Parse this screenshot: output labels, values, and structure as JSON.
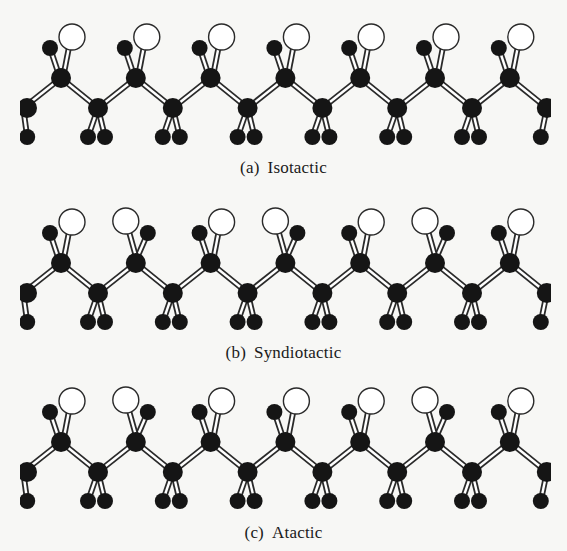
{
  "figure": {
    "width": 567,
    "height": 551,
    "colors": {
      "background": "#f7f7f5",
      "atom_dark": "#151515",
      "atom_light_fill": "#ffffff",
      "atom_light_stroke": "#2a2a2a",
      "bond_outline": "#2a2a2a",
      "bond_fill": "#ffffff"
    },
    "geometry": {
      "period": 74.8,
      "upper_x0": 61,
      "lower_x0": 98,
      "upper_dy": 0,
      "lower_dy": 30,
      "h_dy": 59,
      "carbon_r": 10,
      "h_r": 8,
      "sub_r": 13,
      "units": 7
    }
  },
  "panels": [
    {
      "id": "a",
      "label_tag": "(a)",
      "label_text": "Isotactic",
      "chain_y": 78,
      "label_y": 158,
      "substituent_sides": [
        "R",
        "R",
        "R",
        "R",
        "R",
        "R",
        "R"
      ]
    },
    {
      "id": "b",
      "label_tag": "(b)",
      "label_text": "Syndiotactic",
      "chain_y": 263,
      "label_y": 343,
      "substituent_sides": [
        "R",
        "L",
        "R",
        "L",
        "R",
        "L",
        "R"
      ]
    },
    {
      "id": "c",
      "label_tag": "(c)",
      "label_text": "Atactic",
      "chain_y": 442,
      "label_y": 523,
      "substituent_sides": [
        "R",
        "L",
        "R",
        "R",
        "R",
        "L",
        "R"
      ]
    }
  ],
  "legend": {
    "atom_types": [
      "carbon-backbone-atom",
      "hydrogen-atom",
      "substituent-group"
    ]
  }
}
